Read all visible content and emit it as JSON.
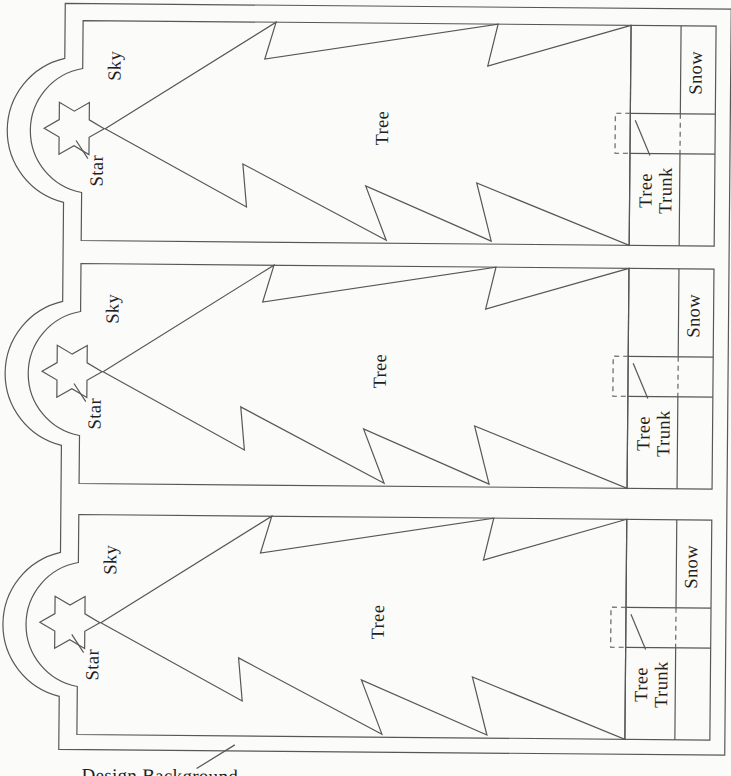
{
  "page": {
    "caption": "Design Background"
  },
  "panels": [
    {
      "labels": {
        "sky": "Sky",
        "star": "Star",
        "tree": "Tree",
        "snow": "Snow",
        "trunk_line1": "Tree",
        "trunk_line2": "Trunk"
      }
    },
    {
      "labels": {
        "sky": "Sky",
        "star": "Star",
        "tree": "Tree",
        "snow": "Snow",
        "trunk_line1": "Tree",
        "trunk_line2": "Trunk"
      }
    },
    {
      "labels": {
        "sky": "Sky",
        "star": "Star",
        "tree": "Tree",
        "snow": "Snow",
        "trunk_line1": "Tree",
        "trunk_line2": "Trunk"
      }
    }
  ],
  "colors": {
    "line": "#575757",
    "text": "#1f1f1f",
    "paper": "#fbfbf9"
  }
}
